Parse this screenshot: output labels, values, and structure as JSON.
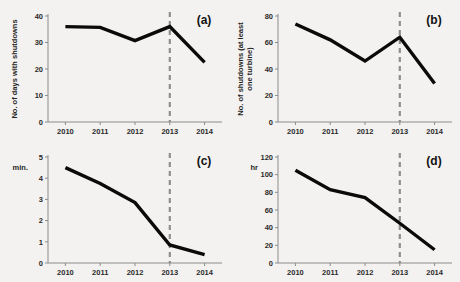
{
  "figure": {
    "background_color": "#f3f2f0",
    "line_color": "#0a0a0a",
    "axis_color": "#8c8c8c",
    "marker_color": "#8e8e8e"
  },
  "chart_data": [
    {
      "id": "a",
      "panel_label": "(a)",
      "type": "line",
      "title": "",
      "xlabel": "",
      "ylabel": "No. of days with shutdowns",
      "ylabel_lines": [
        "No. of days with shutdowns"
      ],
      "unit_label": "",
      "categories": [
        "2010",
        "2011",
        "2012",
        "2013",
        "2014"
      ],
      "x": [
        2010,
        2011,
        2012,
        2013,
        2014
      ],
      "values": [
        36,
        35.7,
        30.7,
        36,
        22.5
      ],
      "ylim": [
        0,
        40
      ],
      "yticks": [
        0,
        10,
        20,
        30,
        40
      ],
      "ytick_labels": [
        "0",
        "10",
        "20",
        "30",
        "40"
      ],
      "grid": false,
      "legend": "none",
      "annotations": [
        {
          "type": "vertical-dashed-line",
          "x": 2013,
          "label": "2013"
        }
      ]
    },
    {
      "id": "b",
      "panel_label": "(b)",
      "type": "line",
      "title": "",
      "xlabel": "",
      "ylabel": "No. of shutdowns (at least one turbine)",
      "ylabel_lines": [
        "No. of shutdowns (at least",
        "one turbine)"
      ],
      "unit_label": "",
      "categories": [
        "2010",
        "2011",
        "2012",
        "2013",
        "2014"
      ],
      "x": [
        2010,
        2011,
        2012,
        2013,
        2014
      ],
      "values": [
        74,
        62,
        46,
        64,
        29
      ],
      "ylim": [
        0,
        80
      ],
      "yticks": [
        0,
        20,
        40,
        60,
        80
      ],
      "ytick_labels": [
        "0",
        "20",
        "40",
        "60",
        "80"
      ],
      "grid": false,
      "legend": "none",
      "annotations": [
        {
          "type": "vertical-dashed-line",
          "x": 2013,
          "label": "2013"
        }
      ]
    },
    {
      "id": "c",
      "panel_label": "(c)",
      "type": "line",
      "title": "",
      "xlabel": "",
      "ylabel": "",
      "ylabel_lines": [],
      "unit_label": "min.",
      "categories": [
        "2010",
        "2011",
        "2012",
        "2013",
        "2014"
      ],
      "x": [
        2010,
        2011,
        2012,
        2013,
        2014
      ],
      "values": [
        4.5,
        3.75,
        2.85,
        0.85,
        0.4
      ],
      "ylim": [
        0,
        5
      ],
      "yticks": [
        0,
        1,
        2,
        3,
        4,
        5
      ],
      "ytick_labels": [
        "0",
        "1",
        "2",
        "3",
        "4",
        "5"
      ],
      "grid": false,
      "legend": "none",
      "annotations": [
        {
          "type": "vertical-dashed-line",
          "x": 2013,
          "label": "2013"
        }
      ]
    },
    {
      "id": "d",
      "panel_label": "(d)",
      "type": "line",
      "title": "",
      "xlabel": "",
      "ylabel": "",
      "ylabel_lines": [],
      "unit_label": "hr",
      "categories": [
        "2010",
        "2011",
        "2012",
        "2013",
        "2014"
      ],
      "x": [
        2010,
        2011,
        2012,
        2013,
        2014
      ],
      "values": [
        105,
        83,
        74,
        45,
        15
      ],
      "ylim": [
        0,
        120
      ],
      "yticks": [
        0,
        20,
        40,
        60,
        80,
        100,
        120
      ],
      "ytick_labels": [
        "0",
        "20",
        "40",
        "60",
        "80",
        "100",
        "120"
      ],
      "grid": false,
      "legend": "none",
      "annotations": [
        {
          "type": "vertical-dashed-line",
          "x": 2013,
          "label": "2013"
        }
      ]
    }
  ]
}
